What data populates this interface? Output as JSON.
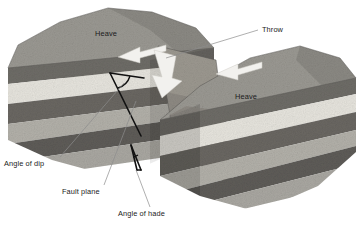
{
  "figure": {
    "background_color": "#ffffff"
  },
  "labels": {
    "heave_left": "Heave",
    "heave_right": "Heave",
    "throw": "Throw",
    "angle_of_dip": "Angle of dip",
    "fault_plane": "Fault plane",
    "angle_of_hade": "Angle of hade"
  },
  "icons": {
    "heave_arrow_left": "arrow-left-icon",
    "heave_arrow_right": "arrow-left-icon",
    "throw_arrow": "arrow-down-icon"
  },
  "colors": {
    "background": "#ffffff",
    "top_surface": "#9a9892",
    "layer_caprock": "#6e6c67",
    "layer_pale": "#e6e4dd",
    "layer_dark": "#6a6762",
    "layer_mid": "#a9a7a1",
    "layer_base_dark": "#5e5c58",
    "fault_plane": "#848079",
    "leader_line": "#8d8d8d",
    "label_text": "#1b1b1b",
    "arrow_fill": "#f2f1ee"
  },
  "blocks": {
    "left": {
      "name": "upthrown-block",
      "layers": [
        "caprock",
        "pale",
        "dark",
        "mid",
        "base-dark"
      ]
    },
    "right": {
      "name": "downthrown-block",
      "layers": [
        "caprock",
        "pale",
        "dark",
        "mid",
        "base-dark"
      ]
    }
  }
}
